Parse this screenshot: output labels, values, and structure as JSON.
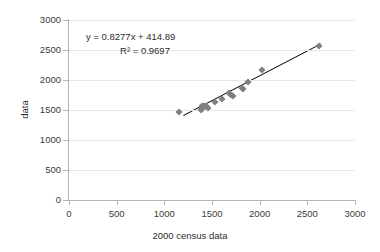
{
  "chart_data": {
    "type": "scatter",
    "title": "",
    "xlabel": "2000 census data",
    "ylabel": "data",
    "xlim": [
      0,
      3000
    ],
    "ylim": [
      0,
      3000
    ],
    "xticks": [
      0,
      500,
      1000,
      1500,
      2000,
      2500,
      3000
    ],
    "yticks": [
      0,
      500,
      1000,
      1500,
      2000,
      2500,
      3000
    ],
    "grid": "horizontal",
    "legend": "none",
    "marker_color": "#808080",
    "marker_shape": "diamond",
    "trendline_color": "#000000",
    "gridline_color": "#e8e8e8",
    "axis_color": "#b5b5b5",
    "annotations": {
      "equation": "y = 0.8277x + 414.89",
      "r_squared": "R² = 0.9697",
      "slope": 0.8277,
      "intercept": 414.89,
      "r2": 0.9697
    },
    "trendline": {
      "x_start": 1200,
      "y_start": 1408,
      "x_end": 2640,
      "y_end": 2600
    },
    "points": [
      {
        "x": 1150,
        "y": 1470
      },
      {
        "x": 1380,
        "y": 1500
      },
      {
        "x": 1390,
        "y": 1520
      },
      {
        "x": 1400,
        "y": 1560
      },
      {
        "x": 1420,
        "y": 1570
      },
      {
        "x": 1440,
        "y": 1560
      },
      {
        "x": 1460,
        "y": 1530
      },
      {
        "x": 1530,
        "y": 1640
      },
      {
        "x": 1600,
        "y": 1680
      },
      {
        "x": 1680,
        "y": 1780
      },
      {
        "x": 1700,
        "y": 1750
      },
      {
        "x": 1720,
        "y": 1740
      },
      {
        "x": 1810,
        "y": 1860
      },
      {
        "x": 1830,
        "y": 1850
      },
      {
        "x": 1880,
        "y": 1960
      },
      {
        "x": 2020,
        "y": 2170
      },
      {
        "x": 2620,
        "y": 2560
      }
    ]
  },
  "axis": {
    "x_title": "2000 census data",
    "y_title": "data",
    "x_tick_labels": [
      "0",
      "500",
      "1000",
      "1500",
      "2000",
      "2500",
      "3000"
    ],
    "y_tick_labels": [
      "0",
      "500",
      "1000",
      "1500",
      "2000",
      "2500",
      "3000"
    ]
  },
  "annotation": {
    "equation_text": "y = 0.8277x + 414.89",
    "r2_text": "R² = 0.9697"
  }
}
